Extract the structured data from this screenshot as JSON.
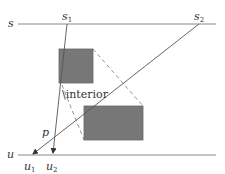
{
  "diagram": {
    "labels": {
      "s": "s",
      "s1_base": "s",
      "s1_sub": "1",
      "s2_base": "s",
      "s2_sub": "2",
      "u": "u",
      "u1_base": "u",
      "u1_sub": "1",
      "u2_base": "u",
      "u2_sub": "2",
      "p": "p",
      "interior": "\\interior"
    },
    "colors": {
      "line": "#888888",
      "ray": "#555555",
      "rect_fill": "#777777",
      "rect_stroke": "#666666",
      "dashed": "#777777",
      "text": "#333333"
    },
    "elements": {
      "line_s": {
        "y": 24,
        "x1": 18,
        "x2": 216
      },
      "line_u": {
        "y": 155,
        "x1": 18,
        "x2": 216
      },
      "point_s1": {
        "x": 67,
        "y": 24
      },
      "point_s2": {
        "x": 199,
        "y": 24
      },
      "point_u1": {
        "x": 32,
        "y": 155
      },
      "point_u2": {
        "x": 53,
        "y": 155
      },
      "point_p": {
        "x": 52,
        "y": 136
      },
      "rect_top": {
        "x": 59,
        "y": 49,
        "w": 34,
        "h": 34
      },
      "rect_bottom": {
        "x": 84,
        "y": 106,
        "w": 59,
        "h": 34
      }
    }
  }
}
